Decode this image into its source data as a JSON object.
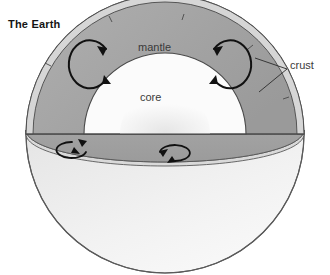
{
  "figure": {
    "title": "The Earth",
    "type": "cutaway cross-section diagram of Earth's interior",
    "background_color": "#ffffff"
  },
  "labels": {
    "mantle": "mantle",
    "core": "core",
    "crust": "crust"
  },
  "layers": [
    {
      "name": "crust",
      "label": "crust",
      "color": "#d6d6d6",
      "description": "thin outer shell shown as a narrow band with offset plate breaks"
    },
    {
      "name": "mantle",
      "label": "mantle",
      "color": "#a6a6a6",
      "description": "thick gray layer between crust and core, cutaway interior"
    },
    {
      "name": "core",
      "label": "core",
      "color": "#fbfbfb",
      "description": "white dome-shaped central region"
    }
  ],
  "globe": {
    "ocean_color": "#ededed",
    "land_color": "#c3c3c3",
    "outline_color": "#4a4a4a",
    "continents": [
      "South America",
      "Africa",
      "Madagascar"
    ]
  },
  "annotations": {
    "crust_leader_lines": 2,
    "convection_arrows_upper": 2,
    "convection_arrows_lower": 2,
    "arrow_color": "#111111"
  },
  "colors": {
    "mantle": "#a6a6a6",
    "mantle_shadow": "#999999",
    "crust": "#d6d6d6",
    "core": "#fbfbfb",
    "ocean": "#ededed",
    "land": "#c3c3c3",
    "stroke": "#4a4a4a",
    "text": "#3a3a3a",
    "title": "#141414"
  }
}
